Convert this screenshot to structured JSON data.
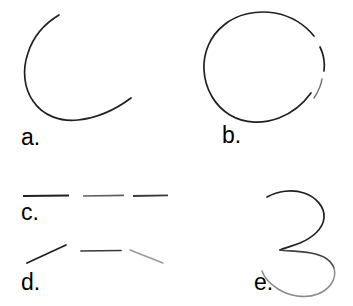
{
  "figure": {
    "width": 353,
    "height": 306,
    "background_color": "#ffffff",
    "stroke_color": "#231f20",
    "stroke_color_light": "#9a9a9a"
  },
  "panels": [
    {
      "id": "a",
      "label": "a.",
      "shape_name": "open-circle-arc",
      "description": "Large circular arc with a wide gap on the upper-right side",
      "label_position": {
        "x": 21,
        "y": 126
      }
    },
    {
      "id": "b",
      "label": "b.",
      "shape_name": "nearly-closed-circle",
      "description": "Circle with two small gaps along the right side",
      "label_position": {
        "x": 222,
        "y": 124
      }
    },
    {
      "id": "c",
      "label": "c.",
      "shape_name": "horizontal-dashed-line",
      "description": "Three collinear horizontal dashes",
      "segment_count": 3,
      "label_position": {
        "x": 21,
        "y": 201
      }
    },
    {
      "id": "d",
      "label": "d.",
      "shape_name": "angled-dashed-path",
      "description": "Three separated straight segments forming a shallow inverted-V path",
      "segment_count": 3,
      "label_position": {
        "x": 21,
        "y": 271
      }
    },
    {
      "id": "e",
      "label": "e.",
      "shape_name": "s-curve-hook",
      "description": "Freehand curve resembling a numeral three with a closing lower hook",
      "label_position": {
        "x": 254,
        "y": 271
      }
    }
  ]
}
